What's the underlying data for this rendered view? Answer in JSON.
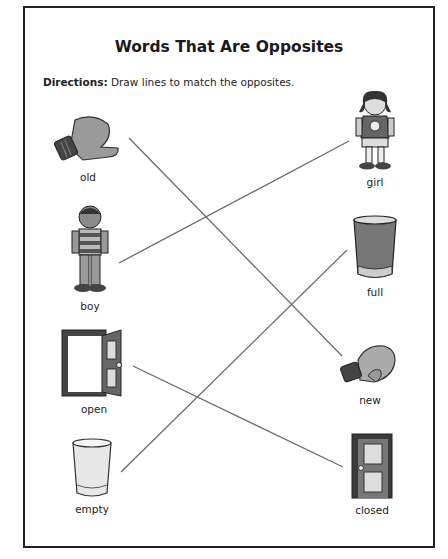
{
  "worksheet": {
    "title": "Words That Are Opposites",
    "directions_label": "Directions:",
    "directions_text": " Draw lines to match the opposites."
  },
  "left_column": [
    {
      "word": "old",
      "icon": "worn-mitten-icon"
    },
    {
      "word": "boy",
      "icon": "boy-icon"
    },
    {
      "word": "open",
      "icon": "open-door-icon"
    },
    {
      "word": "empty",
      "icon": "empty-glass-icon"
    }
  ],
  "right_column": [
    {
      "word": "girl",
      "icon": "girl-icon"
    },
    {
      "word": "full",
      "icon": "full-glass-icon"
    },
    {
      "word": "new",
      "icon": "new-mitten-icon"
    },
    {
      "word": "closed",
      "icon": "closed-door-icon"
    }
  ],
  "matches": [
    {
      "from": "old",
      "to": "new",
      "x1": 129,
      "y1": 138,
      "x2": 342,
      "y2": 356
    },
    {
      "from": "boy",
      "to": "girl",
      "x1": 119,
      "y1": 263,
      "x2": 349,
      "y2": 141
    },
    {
      "from": "open",
      "to": "closed",
      "x1": 133,
      "y1": 366,
      "x2": 343,
      "y2": 467
    },
    {
      "from": "empty",
      "to": "full",
      "x1": 121,
      "y1": 472,
      "x2": 347,
      "y2": 250
    }
  ],
  "colors": {
    "line": "#6b6b6b",
    "border": "#222222"
  }
}
